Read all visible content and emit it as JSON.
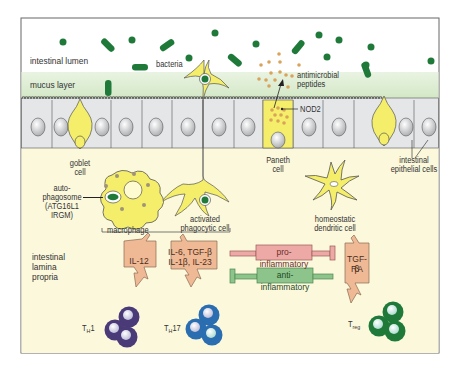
{
  "regions": {
    "lumen": "intestinal lumen",
    "mucus": "mucus layer",
    "lamina_propria": [
      "intestinal",
      "lamina",
      "propria"
    ]
  },
  "labels": {
    "bacteria": "bacteria",
    "antimicrobial_peptides": [
      "antimicrobial",
      "peptides"
    ],
    "nod2": "NOD2",
    "goblet_cell": [
      "goblet",
      "cell"
    ],
    "paneth_cell": [
      "Paneth",
      "cell"
    ],
    "epithelial_cells": [
      "intestinal",
      "epithelial cells"
    ],
    "autophagosome": [
      "auto-",
      "phagosome",
      "(ATG16L1",
      "IRGM)"
    ],
    "macrophage": "macrophage",
    "activated_phagocytic_cell": [
      "activated",
      "phagocytic cell"
    ],
    "homeostatic_dendritic_cell": [
      "homeostatic",
      "dendritic cell"
    ]
  },
  "cytokines": {
    "th1_box": "IL-12",
    "th17_box": [
      "IL-6, TGF-β",
      "IL-1β, IL-23"
    ],
    "treg_box": [
      "TGF-β",
      "RA"
    ]
  },
  "signals": {
    "pro_inflammatory": "pro-inflammatory",
    "anti_inflammatory": "anti-inflammatory"
  },
  "t_cells": {
    "th1": {
      "main": "T",
      "sub": "H",
      "suffix": "1",
      "color": "#4a3a78"
    },
    "th17": {
      "main": "T",
      "sub": "H",
      "suffix": "17",
      "color": "#2a6db0"
    },
    "treg": {
      "main": "T",
      "sub": "reg",
      "suffix": "",
      "color": "#1f7a3a"
    }
  },
  "colors": {
    "lumen_bg": "#ffffff",
    "mucus_bg": "#dcebd2",
    "lamina_bg": "#fbf8dc",
    "epithelium": "#e4e6e8",
    "yellow_cell": "#f5ee6a",
    "bacteria": "#1f7a3a",
    "cytokine_box": "#f0b996",
    "pro_box": "#eda9a5",
    "anti_box": "#8cc48c",
    "peptide_dot": "#d9a35a"
  }
}
